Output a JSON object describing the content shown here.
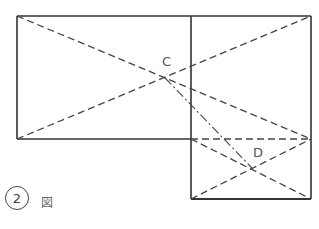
{
  "diagram": {
    "points": {
      "C": {
        "label": "C",
        "x": 165,
        "y": 78
      },
      "D": {
        "label": "D",
        "x": 252,
        "y": 168
      }
    },
    "caption": {
      "number": "2",
      "suffix": "図"
    },
    "colors": {
      "solid": "#333333",
      "dashed": "#444444",
      "text": "#555555"
    }
  }
}
